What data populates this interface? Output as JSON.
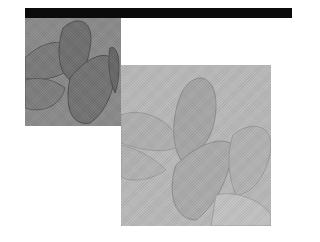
{
  "composition": {
    "bar": {
      "color": "#0b0b0b"
    },
    "squares": [
      {
        "name": "dark-leaf-image",
        "base_color": "#8a8a8a",
        "shape_color": "#6f6f6f",
        "edge_color": "#4e4e4e"
      },
      {
        "name": "light-leaf-image",
        "base_color": "#b9b9b9",
        "shape_color": "#a6a6a6",
        "edge_color": "#8c8c8c"
      }
    ]
  }
}
